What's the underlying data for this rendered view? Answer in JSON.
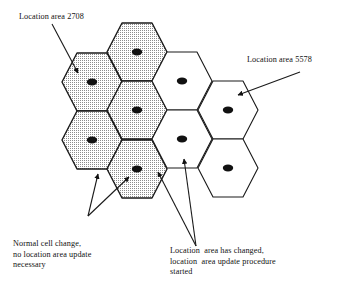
{
  "diagram": {
    "colors": {
      "outline": "#1a1a1a",
      "shaded_fill": "#d9d9d9",
      "plain_fill": "#ffffff",
      "dot": "#111111",
      "text": "#111111",
      "background": "#ffffff"
    },
    "annotations": [
      {
        "id": "la-2708",
        "name": "location-area-2708-label",
        "lines": [
          "Location area 2708"
        ]
      },
      {
        "id": "la-5578",
        "name": "location-area-5578-label",
        "lines": [
          "Location area 5578"
        ]
      },
      {
        "id": "normal-change",
        "name": "normal-cell-change-label",
        "lines": [
          "Normal cell change,",
          "no location area update",
          "necessary"
        ]
      },
      {
        "id": "la-changed",
        "name": "location-area-changed-label",
        "lines": [
          "Location  area has changed,",
          "location  area update procedure",
          "started"
        ]
      }
    ],
    "cells": [
      {
        "id": "c1",
        "name": "cell-shaded-left-upper",
        "cx": 92,
        "cy": 82,
        "shaded": true,
        "area": "2708"
      },
      {
        "id": "c2",
        "name": "cell-shaded-left-lower",
        "cx": 92,
        "cy": 140,
        "shaded": true,
        "area": "2708"
      },
      {
        "id": "c3",
        "name": "cell-shaded-mid-top",
        "cx": 137,
        "cy": 52,
        "shaded": true,
        "area": "2708"
      },
      {
        "id": "c4",
        "name": "cell-shaded-mid-middle",
        "cx": 137,
        "cy": 110,
        "shaded": true,
        "area": "2708"
      },
      {
        "id": "c5",
        "name": "cell-shaded-mid-bottom",
        "cx": 137,
        "cy": 169,
        "shaded": true,
        "area": "2708"
      },
      {
        "id": "c6",
        "name": "cell-plain-right-upper",
        "cx": 182,
        "cy": 81,
        "shaded": false,
        "area": "5578"
      },
      {
        "id": "c7",
        "name": "cell-plain-right-lower",
        "cx": 182,
        "cy": 139,
        "shaded": false,
        "area": "5578"
      },
      {
        "id": "c8",
        "name": "cell-plain-far-upper",
        "cx": 228,
        "cy": 110,
        "shaded": false,
        "area": "5578"
      },
      {
        "id": "c9",
        "name": "cell-plain-far-lower",
        "cx": 228,
        "cy": 168,
        "shaded": false,
        "area": "5578"
      }
    ],
    "pointers": [
      {
        "id": "p1",
        "name": "pointer-to-location-area-2708",
        "x1": 52,
        "y1": 24,
        "x2": 78,
        "y2": 73
      },
      {
        "id": "p2",
        "name": "pointer-to-location-area-5578",
        "x1": 300,
        "y1": 72,
        "x2": 238,
        "y2": 95
      },
      {
        "id": "p3",
        "name": "pointer-normal-change-left",
        "x1": 88,
        "y1": 216,
        "x2": 98,
        "y2": 174
      },
      {
        "id": "p4",
        "name": "pointer-normal-change-right",
        "x1": 88,
        "y1": 216,
        "x2": 129,
        "y2": 177
      },
      {
        "id": "p5",
        "name": "pointer-la-changed-left",
        "x1": 196,
        "y1": 246,
        "x2": 158,
        "y2": 172
      },
      {
        "id": "p6",
        "name": "pointer-la-changed-right",
        "x1": 196,
        "y1": 246,
        "x2": 184,
        "y2": 159
      }
    ]
  }
}
